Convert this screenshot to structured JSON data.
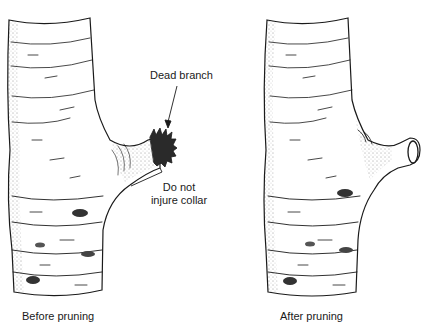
{
  "figure": {
    "panels": [
      {
        "id": "before",
        "caption": "Before pruning"
      },
      {
        "id": "after",
        "caption": "After pruning"
      }
    ],
    "annotations": {
      "dead_branch": "Dead branch",
      "collar_line1": "Do not",
      "collar_line2": "injure collar"
    },
    "colors": {
      "ink": "#1a1a1a",
      "background": "#ffffff",
      "dead_tip": "#2a2a2a"
    }
  }
}
